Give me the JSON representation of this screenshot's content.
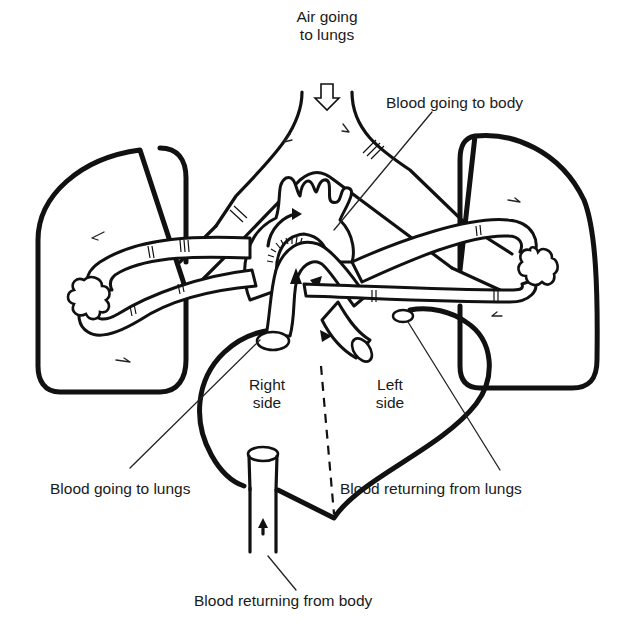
{
  "diagram": {
    "labels": {
      "air": {
        "line1": "Air going",
        "line2": "to lungs"
      },
      "blood_to_body": "Blood going to body",
      "right_side": {
        "line1": "Right",
        "line2": "side"
      },
      "left_side": {
        "line1": "Left",
        "line2": "side"
      },
      "blood_to_lungs": "Blood going to lungs",
      "blood_from_lungs": "Blood returning from lungs",
      "blood_from_body": "Blood returning from body"
    },
    "colors": {
      "ink": "#111111",
      "background": "#ffffff",
      "label_text": "#1a1a1a"
    }
  }
}
